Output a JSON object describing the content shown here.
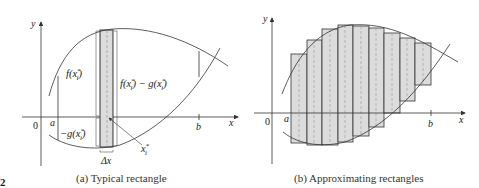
{
  "figure_number_fragment": "2",
  "panel_a": {
    "caption": "(a) Typical rectangle",
    "axis_labels": {
      "x": "x",
      "y": "y",
      "origin": "0",
      "a": "a",
      "b": "b"
    },
    "labels": {
      "f_xi": "f(x",
      "f_xi_close": ")",
      "fg_diff_f": "f(x",
      "fg_diff_mid": ") − g(x",
      "fg_diff_close": ")",
      "neg_g": "−g(x",
      "neg_g_close": ")",
      "subscript_i": "i",
      "superscript_star": "*",
      "delta_x": "Δx",
      "xi_star": "x"
    }
  },
  "panel_b": {
    "caption": "(b) Approximating rectangles",
    "axis_labels": {
      "x": "x",
      "y": "y",
      "origin": "0",
      "a": "a",
      "b": "b"
    },
    "rectangle_count": 9
  },
  "colors": {
    "fill": "#dcdcdc",
    "stroke": "#333333",
    "dashed": "#999999"
  }
}
